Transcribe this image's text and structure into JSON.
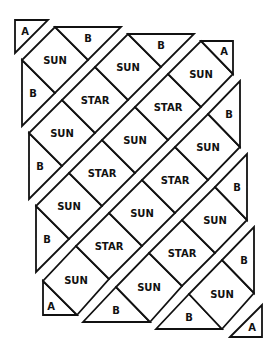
{
  "diagram": {
    "stroke_color": "#111111",
    "fill_color": "#ffffff",
    "pieces": [
      {
        "strip": 0,
        "label": "A",
        "shape": "corner-triangle",
        "points": [
          [
            15,
            20
          ],
          [
            48,
            20
          ],
          [
            15,
            53
          ]
        ],
        "text_pos": [
          25,
          31
        ]
      },
      {
        "strip": 1,
        "label": "B",
        "shape": "edge-triangle",
        "points": [
          [
            22,
            60
          ],
          [
            55,
            93
          ],
          [
            22,
            126
          ]
        ],
        "text_pos": [
          33,
          93
        ]
      },
      {
        "strip": 1,
        "label": "SUN",
        "shape": "square",
        "points": [
          [
            55,
            27
          ],
          [
            88,
            60
          ],
          [
            55,
            93
          ],
          [
            22,
            60
          ]
        ],
        "text_pos": [
          55,
          60
        ]
      },
      {
        "strip": 1,
        "label": "B",
        "shape": "edge-triangle",
        "points": [
          [
            55,
            27
          ],
          [
            121,
            27
          ],
          [
            88,
            60
          ]
        ],
        "text_pos": [
          88,
          38
        ]
      },
      {
        "strip": 2,
        "label": "B",
        "shape": "edge-triangle",
        "points": [
          [
            29,
            133
          ],
          [
            62,
            166
          ],
          [
            29,
            199
          ]
        ],
        "text_pos": [
          40,
          166
        ]
      },
      {
        "strip": 2,
        "label": "SUN",
        "shape": "square",
        "points": [
          [
            62,
            100
          ],
          [
            95,
            133
          ],
          [
            62,
            166
          ],
          [
            29,
            133
          ]
        ],
        "text_pos": [
          62,
          133
        ]
      },
      {
        "strip": 2,
        "label": "STAR",
        "shape": "square",
        "points": [
          [
            95,
            67
          ],
          [
            128,
            100
          ],
          [
            95,
            133
          ],
          [
            62,
            100
          ]
        ],
        "text_pos": [
          95,
          100
        ]
      },
      {
        "strip": 2,
        "label": "SUN",
        "shape": "square",
        "points": [
          [
            128,
            34
          ],
          [
            161,
            67
          ],
          [
            128,
            100
          ],
          [
            95,
            67
          ]
        ],
        "text_pos": [
          128,
          67
        ]
      },
      {
        "strip": 2,
        "label": "B",
        "shape": "edge-triangle",
        "points": [
          [
            128,
            34
          ],
          [
            194,
            34
          ],
          [
            161,
            67
          ]
        ],
        "text_pos": [
          161,
          45
        ]
      },
      {
        "strip": 3,
        "label": "B",
        "shape": "edge-triangle",
        "points": [
          [
            36,
            206
          ],
          [
            69,
            239
          ],
          [
            36,
            272
          ]
        ],
        "text_pos": [
          47,
          239
        ]
      },
      {
        "strip": 3,
        "label": "SUN",
        "shape": "square",
        "points": [
          [
            69,
            173
          ],
          [
            102,
            206
          ],
          [
            69,
            239
          ],
          [
            36,
            206
          ]
        ],
        "text_pos": [
          69,
          206
        ]
      },
      {
        "strip": 3,
        "label": "STAR",
        "shape": "square",
        "points": [
          [
            102,
            140
          ],
          [
            135,
            173
          ],
          [
            102,
            206
          ],
          [
            69,
            173
          ]
        ],
        "text_pos": [
          102,
          173
        ]
      },
      {
        "strip": 3,
        "label": "SUN",
        "shape": "square",
        "points": [
          [
            135,
            107
          ],
          [
            168,
            140
          ],
          [
            135,
            173
          ],
          [
            102,
            140
          ]
        ],
        "text_pos": [
          135,
          140
        ]
      },
      {
        "strip": 3,
        "label": "STAR",
        "shape": "square",
        "points": [
          [
            168,
            74
          ],
          [
            201,
            107
          ],
          [
            168,
            140
          ],
          [
            135,
            107
          ]
        ],
        "text_pos": [
          168,
          107
        ]
      },
      {
        "strip": 3,
        "label": "SUN",
        "shape": "square",
        "points": [
          [
            201,
            41
          ],
          [
            233,
            74
          ],
          [
            201,
            107
          ],
          [
            168,
            74
          ]
        ],
        "text_pos": [
          201,
          74
        ]
      },
      {
        "strip": 3,
        "label": "A",
        "shape": "corner-triangle",
        "points": [
          [
            201,
            41
          ],
          [
            233,
            41
          ],
          [
            233,
            74
          ]
        ],
        "text_pos": [
          224,
          51
        ]
      },
      {
        "strip": 4,
        "label": "A",
        "shape": "corner-triangle",
        "points": [
          [
            43,
            281
          ],
          [
            43,
            315
          ],
          [
            77,
            315
          ]
        ],
        "text_pos": [
          51,
          306
        ]
      },
      {
        "strip": 4,
        "label": "SUN",
        "shape": "square",
        "points": [
          [
            76,
            246
          ],
          [
            109,
            279
          ],
          [
            77,
            315
          ],
          [
            43,
            281
          ]
        ],
        "text_pos": [
          76,
          280
        ]
      },
      {
        "strip": 4,
        "label": "STAR",
        "shape": "square",
        "points": [
          [
            109,
            213
          ],
          [
            142,
            246
          ],
          [
            109,
            279
          ],
          [
            76,
            246
          ]
        ],
        "text_pos": [
          109,
          246
        ]
      },
      {
        "strip": 4,
        "label": "SUN",
        "shape": "square",
        "points": [
          [
            142,
            180
          ],
          [
            175,
            213
          ],
          [
            142,
            246
          ],
          [
            109,
            213
          ]
        ],
        "text_pos": [
          142,
          213
        ]
      },
      {
        "strip": 4,
        "label": "STAR",
        "shape": "square",
        "points": [
          [
            175,
            147
          ],
          [
            208,
            180
          ],
          [
            175,
            213
          ],
          [
            142,
            180
          ]
        ],
        "text_pos": [
          175,
          180
        ]
      },
      {
        "strip": 4,
        "label": "SUN",
        "shape": "square",
        "points": [
          [
            208,
            114
          ],
          [
            240,
            147
          ],
          [
            208,
            180
          ],
          [
            175,
            147
          ]
        ],
        "text_pos": [
          208,
          147
        ]
      },
      {
        "strip": 4,
        "label": "B",
        "shape": "edge-triangle",
        "points": [
          [
            240,
            81
          ],
          [
            240,
            147
          ],
          [
            208,
            114
          ]
        ],
        "text_pos": [
          229,
          114
        ]
      },
      {
        "strip": 5,
        "label": "B",
        "shape": "edge-triangle",
        "points": [
          [
            83,
            322
          ],
          [
            116,
            287
          ],
          [
            150,
            322
          ]
        ],
        "text_pos": [
          116,
          310
        ]
      },
      {
        "strip": 5,
        "label": "SUN",
        "shape": "square",
        "points": [
          [
            149,
            253
          ],
          [
            182,
            286
          ],
          [
            150,
            322
          ],
          [
            116,
            287
          ]
        ],
        "text_pos": [
          149,
          287
        ]
      },
      {
        "strip": 5,
        "label": "STAR",
        "shape": "square",
        "points": [
          [
            182,
            220
          ],
          [
            215,
            253
          ],
          [
            182,
            286
          ],
          [
            149,
            253
          ]
        ],
        "text_pos": [
          182,
          253
        ]
      },
      {
        "strip": 5,
        "label": "SUN",
        "shape": "square",
        "points": [
          [
            215,
            187
          ],
          [
            247,
            220
          ],
          [
            215,
            253
          ],
          [
            182,
            220
          ]
        ],
        "text_pos": [
          215,
          220
        ]
      },
      {
        "strip": 5,
        "label": "B",
        "shape": "edge-triangle",
        "points": [
          [
            247,
            154
          ],
          [
            247,
            220
          ],
          [
            215,
            187
          ]
        ],
        "text_pos": [
          237,
          187
        ]
      },
      {
        "strip": 6,
        "label": "B",
        "shape": "edge-triangle",
        "points": [
          [
            156,
            329
          ],
          [
            189,
            294
          ],
          [
            222,
            329
          ]
        ],
        "text_pos": [
          189,
          317
        ]
      },
      {
        "strip": 6,
        "label": "SUN",
        "shape": "square",
        "points": [
          [
            222,
            260
          ],
          [
            254,
            293
          ],
          [
            222,
            329
          ],
          [
            189,
            294
          ]
        ],
        "text_pos": [
          222,
          294
        ]
      },
      {
        "strip": 6,
        "label": "B",
        "shape": "edge-triangle",
        "points": [
          [
            254,
            227
          ],
          [
            254,
            293
          ],
          [
            222,
            260
          ]
        ],
        "text_pos": [
          244,
          260
        ]
      },
      {
        "strip": 7,
        "label": "A",
        "shape": "corner-triangle",
        "points": [
          [
            230,
            337
          ],
          [
            262,
            305
          ],
          [
            262,
            337
          ]
        ],
        "text_pos": [
          252,
          327
        ]
      }
    ]
  }
}
